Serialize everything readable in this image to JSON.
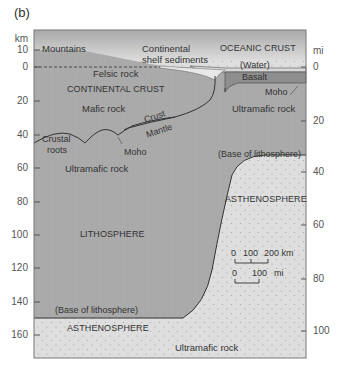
{
  "panel_label": "(b)",
  "axes": {
    "left_unit": "km",
    "right_unit": "mi",
    "left_ticks": [
      "10",
      "0",
      "20",
      "40",
      "60",
      "80",
      "100",
      "120",
      "140",
      "160"
    ],
    "right_ticks": [
      "0",
      "20",
      "40",
      "60",
      "80",
      "100"
    ]
  },
  "regions": {
    "mountains": "Mountains",
    "shelf_sediments_line1": "Continental",
    "shelf_sediments_line2": "shelf sediments",
    "oceanic_crust": "OCEANIC CRUST",
    "water": "(Water)",
    "basalt": "Basalt",
    "moho_right": "Moho",
    "felsic_rock": "Felsic rock",
    "continental_crust": "CONTINENTAL CRUST",
    "mafic_rock": "Mafic rock",
    "ultramafic_right": "Ultramafic rock",
    "crust": "Crust",
    "mantle": "Mantle",
    "crustal_roots_line1": "Crustal",
    "crustal_roots_line2": "roots",
    "moho_left": "Moho",
    "ultramafic_left": "Ultramafic rock",
    "base_lithosphere_right": "(Base of lithosphere)",
    "asthenosphere_right": "ASTHENOSPHERE",
    "lithosphere": "LITHOSPHERE",
    "base_lithosphere_left": "(Base of lithosphere)",
    "asthenosphere_bottom": "ASTHENOSPHERE",
    "ultramafic_bottom": "Ultramafic rock"
  },
  "scale_bar": {
    "km_labels": [
      "0",
      "100",
      "200 km"
    ],
    "mi_labels": [
      "0",
      "100",
      "mi"
    ]
  },
  "colors": {
    "lithosphere_fill": "#a9a9a9",
    "asthenosphere_fill": "#dcdcdc",
    "sky_top": "#a8a8a8",
    "sky_bottom": "#e6e6e6",
    "basalt_fill": "#8f8f8f",
    "line": "#333333"
  }
}
